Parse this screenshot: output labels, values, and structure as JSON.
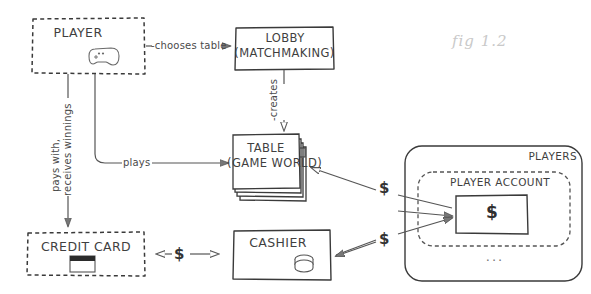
{
  "figure": {
    "caption": "fig 1.2",
    "caption_color": "#c9c9c9",
    "ink_color": "#3f3f3f",
    "background": "#ffffff",
    "width": 591,
    "height": 294
  },
  "nodes": {
    "player": {
      "label": "PLAYER",
      "icon": "gamepad-icon",
      "border": "dashed"
    },
    "lobby": {
      "label_line1": "LOBBY",
      "label_line2": "(MATCHMAKING)",
      "border": "solid"
    },
    "table": {
      "label_line1": "TABLE",
      "label_line2": "(GAME WORLD)",
      "border": "solid",
      "stacked": "true",
      "stack_count": 4
    },
    "credit_card": {
      "label": "CREDIT CARD",
      "icon": "credit-card-icon",
      "border": "dashed"
    },
    "cashier": {
      "label": "CASHIER",
      "icon": "coins-icon",
      "border": "solid"
    },
    "players_group": {
      "label": "PLAYERS",
      "border": "solid-rounded"
    },
    "player_account": {
      "label": "PLAYER ACCOUNT",
      "border": "dashed-rounded"
    },
    "balance": {
      "label": "$",
      "border": "solid"
    },
    "ellipsis": {
      "label": "..."
    }
  },
  "edges": [
    {
      "id": "player-chooses-table",
      "label": "-chooses table",
      "from": "player",
      "to": "lobby",
      "direction": "one-way"
    },
    {
      "id": "lobby-creates-table",
      "label": "-creates",
      "from": "lobby",
      "to": "table",
      "direction": "one-way",
      "orientation": "vertical"
    },
    {
      "id": "player-plays-table",
      "label": "plays",
      "from": "player",
      "to": "table",
      "direction": "one-way"
    },
    {
      "id": "player-pays-credit-card",
      "label": "pays with,\nreceives winnings",
      "label_line1": "pays with,",
      "label_line2": "receives winnings",
      "from": "player",
      "to": "credit_card",
      "direction": "one-way",
      "orientation": "vertical"
    },
    {
      "id": "credit-card-cashier",
      "label": "$",
      "from": "credit_card",
      "to": "cashier",
      "direction": "two-way"
    },
    {
      "id": "account-table",
      "label": "$",
      "from": "player_account",
      "to": "table",
      "direction": "one-way"
    },
    {
      "id": "account-cashier",
      "label": "$",
      "from": "cashier",
      "to": "player_account",
      "direction": "two-way"
    }
  ]
}
